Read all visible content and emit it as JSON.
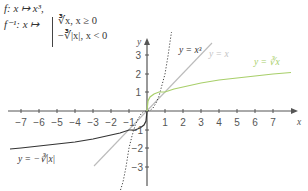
{
  "formulas": {
    "f": "f: x ↦ x³,",
    "finv": "f⁻¹: x ↦",
    "case1": "∛x, x ≥ 0",
    "case2": "−∛|x|, x < 0"
  },
  "axes": {
    "x_label": "x",
    "y_label": "y",
    "x_ticks": [
      "−7",
      "−6",
      "−5",
      "−4",
      "−3",
      "−2",
      "−1",
      "1",
      "2",
      "3",
      "4",
      "5",
      "6",
      "7"
    ],
    "y_ticks": [
      "3",
      "2",
      "1",
      "−1",
      "−2",
      "−3"
    ],
    "xlim": [
      -7.5,
      8
    ],
    "ylim": [
      -3.8,
      4
    ]
  },
  "curves": [
    {
      "name": "y=x³",
      "label": "y = x³",
      "style": "dotted",
      "color": "#444444"
    },
    {
      "name": "y=x",
      "label": "y = x",
      "style": "solid",
      "color": "#bbbbbb"
    },
    {
      "name": "y=∛x",
      "label": "y = ∛x",
      "style": "solid",
      "color": "#a8cf6a"
    },
    {
      "name": "y=−∛|x|",
      "label": "y = −∛|x|",
      "style": "solid",
      "color": "#333333"
    }
  ],
  "colors": {
    "axis": "#555555",
    "cube": "#444444",
    "identity": "#bbbbbb",
    "cbrt_pos": "#a8cf6a",
    "cbrt_neg": "#333333"
  }
}
